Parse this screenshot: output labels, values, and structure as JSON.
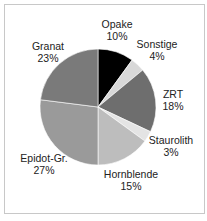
{
  "chart_data": {
    "type": "pie",
    "title": "",
    "slices": [
      {
        "label": "Opake",
        "value": 10,
        "pct_label": "10%",
        "color": "#000000"
      },
      {
        "label": "Sonstige",
        "value": 4,
        "pct_label": "4%",
        "color": "#d8d8d8"
      },
      {
        "label": "ZRT",
        "value": 18,
        "pct_label": "18%",
        "color": "#6e6e6e"
      },
      {
        "label": "Staurolith",
        "value": 3,
        "pct_label": "3%",
        "color": "#e4e4e4"
      },
      {
        "label": "Hornblende",
        "value": 15,
        "pct_label": "15%",
        "color": "#bdbdbd"
      },
      {
        "label": "Epidot-Gr.",
        "value": 27,
        "pct_label": "27%",
        "color": "#9a9a9a"
      },
      {
        "label": "Granat",
        "value": 23,
        "pct_label": "23%",
        "color": "#7a7a7a"
      }
    ],
    "start_angle": "12 o'clock",
    "direction": "clockwise",
    "legend": "none (labels outside slices)"
  }
}
